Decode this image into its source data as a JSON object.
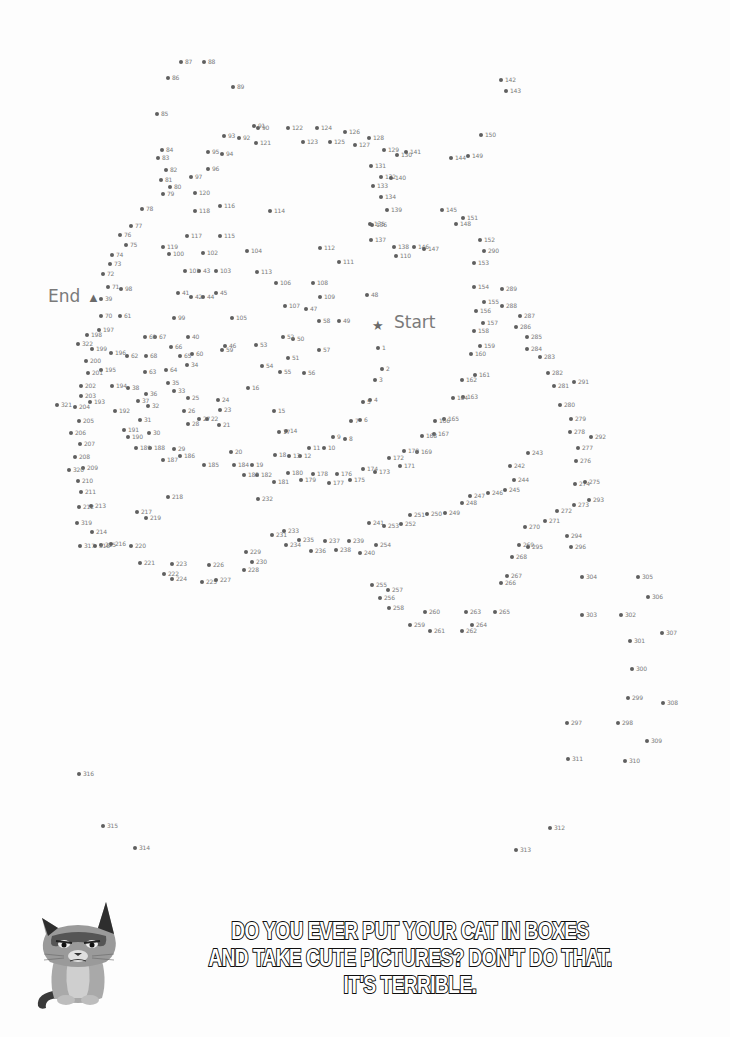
{
  "puzzle": {
    "start_label": "Start",
    "end_label": "End",
    "start_icon": "star-icon",
    "end_icon": "triangle-icon",
    "start_pos": [
      378,
      326
    ],
    "end_pos": [
      93,
      298
    ],
    "dot_color": "#5f5f5f",
    "label_color": "#7a7a7a",
    "dots": [
      [
        1,
        378,
        348
      ],
      [
        2,
        382,
        369
      ],
      [
        3,
        375,
        380
      ],
      [
        4,
        370,
        400
      ],
      [
        5,
        363,
        402
      ],
      [
        6,
        360,
        420
      ],
      [
        7,
        351,
        421
      ],
      [
        8,
        345,
        439
      ],
      [
        9,
        333,
        437
      ],
      [
        10,
        324,
        448
      ],
      [
        11,
        309,
        448
      ],
      [
        12,
        300,
        456
      ],
      [
        13,
        289,
        456
      ],
      [
        14,
        286,
        431
      ],
      [
        15,
        274,
        411
      ],
      [
        16,
        248,
        388
      ],
      [
        17,
        279,
        432
      ],
      [
        18,
        275,
        455
      ],
      [
        19,
        252,
        465
      ],
      [
        20,
        231,
        452
      ],
      [
        21,
        219,
        425
      ],
      [
        22,
        207,
        419
      ],
      [
        23,
        220,
        410
      ],
      [
        24,
        218,
        400
      ],
      [
        25,
        188,
        398
      ],
      [
        26,
        184,
        411
      ],
      [
        27,
        199,
        419
      ],
      [
        28,
        188,
        424
      ],
      [
        29,
        174,
        449
      ],
      [
        30,
        149,
        433
      ],
      [
        31,
        140,
        420
      ],
      [
        32,
        148,
        406
      ],
      [
        33,
        174,
        391
      ],
      [
        34,
        187,
        365
      ],
      [
        35,
        168,
        383
      ],
      [
        36,
        146,
        394
      ],
      [
        37,
        138,
        401
      ],
      [
        38,
        128,
        388
      ],
      [
        39,
        101,
        299
      ],
      [
        40,
        188,
        337
      ],
      [
        41,
        178,
        293
      ],
      [
        42,
        191,
        297
      ],
      [
        43,
        199,
        271
      ],
      [
        44,
        203,
        297
      ],
      [
        45,
        216,
        293
      ],
      [
        46,
        225,
        346
      ],
      [
        47,
        306,
        309
      ],
      [
        48,
        367,
        295
      ],
      [
        49,
        339,
        321
      ],
      [
        50,
        293,
        339
      ],
      [
        51,
        288,
        358
      ],
      [
        52,
        283,
        337
      ],
      [
        53,
        256,
        345
      ],
      [
        54,
        262,
        366
      ],
      [
        55,
        280,
        372
      ],
      [
        56,
        304,
        373
      ],
      [
        57,
        319,
        350
      ],
      [
        58,
        319,
        321
      ],
      [
        59,
        222,
        350
      ],
      [
        60,
        192,
        354
      ],
      [
        61,
        120,
        316
      ],
      [
        62,
        127,
        356
      ],
      [
        63,
        145,
        372
      ],
      [
        64,
        166,
        370
      ],
      [
        65,
        180,
        356
      ],
      [
        66,
        171,
        347
      ],
      [
        67,
        155,
        337
      ],
      [
        68,
        146,
        356
      ],
      [
        69,
        145,
        337
      ],
      [
        70,
        101,
        316
      ],
      [
        71,
        108,
        287
      ],
      [
        72,
        103,
        274
      ],
      [
        73,
        110,
        264
      ],
      [
        74,
        112,
        255
      ],
      [
        75,
        126,
        245
      ],
      [
        76,
        120,
        235
      ],
      [
        77,
        131,
        226
      ],
      [
        78,
        142,
        209
      ],
      [
        79,
        163,
        194
      ],
      [
        80,
        170,
        187
      ],
      [
        81,
        161,
        180
      ],
      [
        82,
        166,
        170
      ],
      [
        83,
        158,
        158
      ],
      [
        84,
        162,
        150
      ],
      [
        85,
        157,
        114
      ],
      [
        86,
        168,
        78
      ],
      [
        87,
        181,
        62
      ],
      [
        88,
        204,
        62
      ],
      [
        89,
        233,
        87
      ],
      [
        90,
        258,
        128
      ],
      [
        91,
        254,
        126
      ],
      [
        92,
        239,
        138
      ],
      [
        93,
        224,
        136
      ],
      [
        94,
        222,
        154
      ],
      [
        95,
        208,
        152
      ],
      [
        96,
        208,
        169
      ],
      [
        97,
        191,
        177
      ],
      [
        98,
        121,
        289
      ],
      [
        99,
        174,
        318
      ],
      [
        100,
        169,
        254
      ],
      [
        101,
        185,
        271
      ],
      [
        102,
        203,
        253
      ],
      [
        103,
        216,
        271
      ],
      [
        104,
        247,
        251
      ],
      [
        105,
        232,
        318
      ],
      [
        106,
        276,
        283
      ],
      [
        107,
        285,
        306
      ],
      [
        108,
        313,
        283
      ],
      [
        109,
        320,
        297
      ],
      [
        110,
        396,
        256
      ],
      [
        111,
        339,
        262
      ],
      [
        112,
        320,
        248
      ],
      [
        113,
        257,
        272
      ],
      [
        114,
        270,
        211
      ],
      [
        115,
        220,
        236
      ],
      [
        116,
        220,
        206
      ],
      [
        117,
        187,
        236
      ],
      [
        118,
        195,
        211
      ],
      [
        119,
        163,
        247
      ],
      [
        120,
        195,
        193
      ],
      [
        121,
        256,
        143
      ],
      [
        122,
        288,
        128
      ],
      [
        123,
        303,
        142
      ],
      [
        124,
        317,
        128
      ],
      [
        125,
        330,
        142
      ],
      [
        126,
        345,
        132
      ],
      [
        127,
        355,
        145
      ],
      [
        128,
        369,
        138
      ],
      [
        129,
        384,
        150
      ],
      [
        130,
        397,
        155
      ],
      [
        131,
        371,
        166
      ],
      [
        132,
        381,
        177
      ],
      [
        133,
        373,
        186
      ],
      [
        134,
        381,
        197
      ],
      [
        135,
        370,
        224
      ],
      [
        136,
        372,
        225
      ],
      [
        137,
        371,
        240
      ],
      [
        138,
        394,
        247
      ],
      [
        139,
        387,
        210
      ],
      [
        140,
        391,
        178
      ],
      [
        141,
        406,
        152
      ],
      [
        142,
        501,
        80
      ],
      [
        143,
        506,
        91
      ],
      [
        144,
        451,
        158
      ],
      [
        145,
        442,
        210
      ],
      [
        146,
        414,
        247
      ],
      [
        147,
        424,
        249
      ],
      [
        148,
        456,
        224
      ],
      [
        149,
        468,
        156
      ],
      [
        150,
        481,
        135
      ],
      [
        151,
        463,
        218
      ],
      [
        152,
        480,
        240
      ],
      [
        153,
        474,
        263
      ],
      [
        154,
        474,
        287
      ],
      [
        155,
        484,
        302
      ],
      [
        156,
        476,
        311
      ],
      [
        157,
        483,
        323
      ],
      [
        158,
        474,
        331
      ],
      [
        159,
        480,
        346
      ],
      [
        160,
        471,
        354
      ],
      [
        161,
        475,
        375
      ],
      [
        162,
        462,
        380
      ],
      [
        163,
        463,
        397
      ],
      [
        164,
        453,
        398
      ],
      [
        165,
        444,
        419
      ],
      [
        166,
        435,
        421
      ],
      [
        167,
        434,
        434
      ],
      [
        168,
        422,
        436
      ],
      [
        169,
        417,
        452
      ],
      [
        170,
        404,
        451
      ],
      [
        171,
        400,
        466
      ],
      [
        172,
        389,
        458
      ],
      [
        173,
        375,
        472
      ],
      [
        174,
        363,
        469
      ],
      [
        175,
        350,
        480
      ],
      [
        176,
        337,
        474
      ],
      [
        177,
        329,
        483
      ],
      [
        178,
        313,
        474
      ],
      [
        179,
        301,
        480
      ],
      [
        180,
        288,
        473
      ],
      [
        181,
        274,
        482
      ],
      [
        182,
        257,
        475
      ],
      [
        183,
        244,
        475
      ],
      [
        184,
        234,
        465
      ],
      [
        185,
        204,
        465
      ],
      [
        186,
        180,
        456
      ],
      [
        187,
        163,
        460
      ],
      [
        188,
        150,
        448
      ],
      [
        189,
        136,
        448
      ],
      [
        190,
        128,
        437
      ],
      [
        191,
        124,
        430
      ],
      [
        192,
        115,
        411
      ],
      [
        193,
        90,
        402
      ],
      [
        194,
        112,
        386
      ],
      [
        195,
        101,
        370
      ],
      [
        196,
        111,
        353
      ],
      [
        197,
        99,
        330
      ],
      [
        198,
        87,
        335
      ],
      [
        199,
        92,
        349
      ],
      [
        200,
        86,
        361
      ],
      [
        201,
        88,
        373
      ],
      [
        202,
        81,
        386
      ],
      [
        203,
        81,
        396
      ],
      [
        204,
        75,
        407
      ],
      [
        205,
        79,
        421
      ],
      [
        206,
        71,
        433
      ],
      [
        207,
        80,
        444
      ],
      [
        208,
        75,
        457
      ],
      [
        209,
        83,
        468
      ],
      [
        210,
        78,
        481
      ],
      [
        211,
        81,
        492
      ],
      [
        212,
        79,
        507
      ],
      [
        213,
        91,
        506
      ],
      [
        214,
        92,
        532
      ],
      [
        215,
        101,
        545
      ],
      [
        216,
        111,
        544
      ],
      [
        217,
        137,
        512
      ],
      [
        218,
        168,
        497
      ],
      [
        219,
        146,
        518
      ],
      [
        220,
        131,
        546
      ],
      [
        221,
        140,
        563
      ],
      [
        222,
        164,
        574
      ],
      [
        223,
        172,
        564
      ],
      [
        224,
        172,
        579
      ],
      [
        225,
        202,
        582
      ],
      [
        226,
        209,
        565
      ],
      [
        227,
        216,
        580
      ],
      [
        228,
        244,
        570
      ],
      [
        229,
        246,
        552
      ],
      [
        230,
        252,
        562
      ],
      [
        231,
        272,
        535
      ],
      [
        232,
        258,
        499
      ],
      [
        233,
        284,
        531
      ],
      [
        234,
        286,
        545
      ],
      [
        235,
        299,
        540
      ],
      [
        236,
        311,
        551
      ],
      [
        237,
        325,
        541
      ],
      [
        238,
        336,
        550
      ],
      [
        239,
        349,
        541
      ],
      [
        240,
        360,
        553
      ],
      [
        241,
        369,
        523
      ],
      [
        242,
        510,
        466
      ],
      [
        243,
        528,
        453
      ],
      [
        244,
        514,
        480
      ],
      [
        245,
        505,
        490
      ],
      [
        246,
        488,
        493
      ],
      [
        247,
        470,
        496
      ],
      [
        248,
        462,
        503
      ],
      [
        249,
        445,
        513
      ],
      [
        250,
        427,
        514
      ],
      [
        251,
        410,
        515
      ],
      [
        252,
        401,
        524
      ],
      [
        253,
        384,
        526
      ],
      [
        254,
        376,
        545
      ],
      [
        255,
        372,
        585
      ],
      [
        256,
        380,
        598
      ],
      [
        257,
        388,
        590
      ],
      [
        258,
        389,
        608
      ],
      [
        259,
        410,
        625
      ],
      [
        260,
        425,
        612
      ],
      [
        261,
        430,
        631
      ],
      [
        262,
        462,
        631
      ],
      [
        263,
        466,
        612
      ],
      [
        264,
        472,
        625
      ],
      [
        265,
        495,
        612
      ],
      [
        266,
        501,
        583
      ],
      [
        267,
        507,
        576
      ],
      [
        268,
        512,
        557
      ],
      [
        269,
        519,
        545
      ],
      [
        270,
        525,
        527
      ],
      [
        271,
        545,
        521
      ],
      [
        272,
        557,
        511
      ],
      [
        273,
        574,
        505
      ],
      [
        274,
        575,
        484
      ],
      [
        275,
        585,
        482
      ],
      [
        276,
        576,
        461
      ],
      [
        277,
        578,
        448
      ],
      [
        278,
        570,
        432
      ],
      [
        279,
        571,
        419
      ],
      [
        280,
        560,
        405
      ],
      [
        281,
        554,
        386
      ],
      [
        282,
        548,
        373
      ],
      [
        283,
        540,
        357
      ],
      [
        284,
        527,
        349
      ],
      [
        285,
        527,
        337
      ],
      [
        286,
        516,
        327
      ],
      [
        287,
        520,
        316
      ],
      [
        288,
        502,
        306
      ],
      [
        289,
        502,
        289
      ],
      [
        290,
        484,
        251
      ],
      [
        291,
        574,
        382
      ],
      [
        292,
        591,
        437
      ],
      [
        293,
        589,
        500
      ],
      [
        294,
        567,
        536
      ],
      [
        295,
        528,
        547
      ],
      [
        296,
        571,
        547
      ],
      [
        297,
        567,
        723
      ],
      [
        298,
        618,
        723
      ],
      [
        299,
        628,
        698
      ],
      [
        300,
        632,
        669
      ],
      [
        301,
        630,
        641
      ],
      [
        302,
        621,
        615
      ],
      [
        303,
        582,
        615
      ],
      [
        304,
        582,
        577
      ],
      [
        305,
        638,
        577
      ],
      [
        306,
        648,
        597
      ],
      [
        307,
        662,
        633
      ],
      [
        308,
        663,
        703
      ],
      [
        309,
        647,
        741
      ],
      [
        310,
        625,
        761
      ],
      [
        311,
        568,
        759
      ],
      [
        312,
        550,
        828
      ],
      [
        313,
        516,
        850
      ],
      [
        314,
        135,
        848
      ],
      [
        315,
        103,
        826
      ],
      [
        316,
        79,
        774
      ],
      [
        317,
        80,
        546
      ],
      [
        318,
        95,
        546
      ],
      [
        319,
        77,
        523
      ],
      [
        320,
        69,
        470
      ],
      [
        321,
        57,
        405
      ],
      [
        322,
        78,
        344
      ]
    ]
  },
  "caption": {
    "lines": [
      "DO YOU EVER PUT YOUR CAT IN BOXES",
      "AND TAKE CUTE PICTURES?  DON'T DO THAT.",
      "IT'S TERRIBLE."
    ]
  },
  "illustration": {
    "name": "grumpy-cat-illustration"
  }
}
